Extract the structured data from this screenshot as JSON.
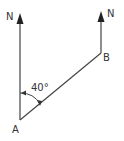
{
  "diagram": {
    "type": "bearing-diagram",
    "labels": {
      "north_left": "N",
      "north_right": "N",
      "point_a": "A",
      "point_b": "B",
      "angle": "40°"
    },
    "colors": {
      "line": "#444444",
      "text": "#333333",
      "background": "#ffffff"
    },
    "points": {
      "A": [
        20,
        120
      ],
      "B": [
        101,
        53
      ]
    },
    "bearing_degrees": 40
  }
}
